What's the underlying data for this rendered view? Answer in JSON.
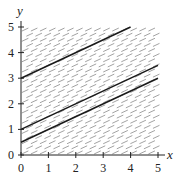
{
  "chart_data": {
    "type": "line",
    "title": "",
    "xlabel": "x",
    "ylabel": "y",
    "xlim": [
      0,
      5
    ],
    "ylim": [
      0,
      5
    ],
    "x_ticks": [
      "0",
      "1",
      "2",
      "3",
      "4",
      "5"
    ],
    "y_ticks": [
      "0",
      "1",
      "2",
      "3",
      "4",
      "5"
    ],
    "grid": false,
    "legend": null,
    "direction_field": {
      "slope": 0.5,
      "x_step": 0.33,
      "y_step": 0.2,
      "color": "#8a8a8a"
    },
    "series": [
      {
        "name": "solution-curve-1",
        "x": [
          0,
          4
        ],
        "y": [
          3,
          5
        ],
        "color": "#1a1a1a"
      },
      {
        "name": "solution-curve-2",
        "x": [
          0,
          5
        ],
        "y": [
          1,
          3.5
        ],
        "color": "#1a1a1a"
      },
      {
        "name": "solution-curve-3",
        "x": [
          0,
          5
        ],
        "y": [
          0.5,
          3
        ],
        "color": "#1a1a1a"
      }
    ]
  }
}
